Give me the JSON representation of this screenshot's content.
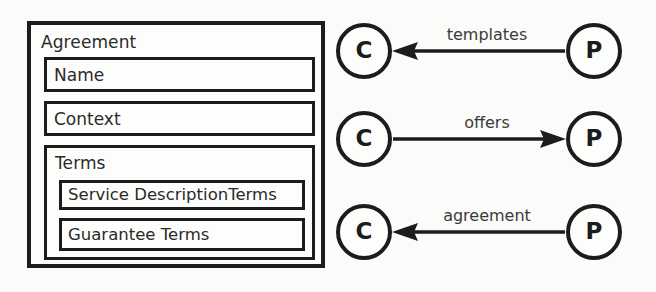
{
  "diagram": {
    "background_color": "#fbfbf9",
    "stroke_color": "#1c1c1c",
    "agreement": {
      "title": "Agreement",
      "fields": [
        {
          "label": "Name"
        },
        {
          "label": "Context"
        }
      ],
      "terms": {
        "title": "Terms",
        "items": [
          {
            "label": "Service DescriptionTerms"
          },
          {
            "label": "Guarantee Terms"
          }
        ]
      }
    },
    "relationships": [
      {
        "source_label": "P",
        "target_label": "C",
        "edge_label": "templates",
        "direction": "right-to-left"
      },
      {
        "source_label": "C",
        "target_label": "P",
        "edge_label": "offers",
        "direction": "left-to-right"
      },
      {
        "source_label": "P",
        "target_label": "C",
        "edge_label": "agreement",
        "direction": "right-to-left"
      }
    ]
  }
}
